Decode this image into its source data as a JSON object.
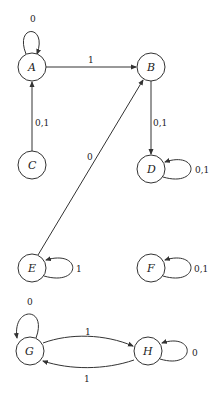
{
  "diagram": {
    "type": "state-transition-graph",
    "nodes": [
      {
        "id": "A",
        "label": "A",
        "x": 32,
        "y": 67
      },
      {
        "id": "B",
        "label": "B",
        "x": 151,
        "y": 67
      },
      {
        "id": "C",
        "label": "C",
        "x": 32,
        "y": 165
      },
      {
        "id": "D",
        "label": "D",
        "x": 151,
        "y": 169
      },
      {
        "id": "E",
        "label": "E",
        "x": 32,
        "y": 268
      },
      {
        "id": "F",
        "label": "F",
        "x": 151,
        "y": 268
      },
      {
        "id": "G",
        "label": "G",
        "x": 30,
        "y": 351
      },
      {
        "id": "H",
        "label": "H",
        "x": 148,
        "y": 351
      }
    ],
    "edges": [
      {
        "from": "A",
        "to": "A",
        "label": "0"
      },
      {
        "from": "A",
        "to": "B",
        "label": "1"
      },
      {
        "from": "C",
        "to": "A",
        "label": "0,1"
      },
      {
        "from": "B",
        "to": "D",
        "label": "0,1"
      },
      {
        "from": "D",
        "to": "D",
        "label": "0,1"
      },
      {
        "from": "E",
        "to": "B",
        "label": "0"
      },
      {
        "from": "E",
        "to": "E",
        "label": "1"
      },
      {
        "from": "F",
        "to": "F",
        "label": "0,1"
      },
      {
        "from": "G",
        "to": "G",
        "label": "0"
      },
      {
        "from": "G",
        "to": "H",
        "label": "1"
      },
      {
        "from": "H",
        "to": "G",
        "label": "1"
      },
      {
        "from": "H",
        "to": "H",
        "label": "0"
      }
    ]
  }
}
